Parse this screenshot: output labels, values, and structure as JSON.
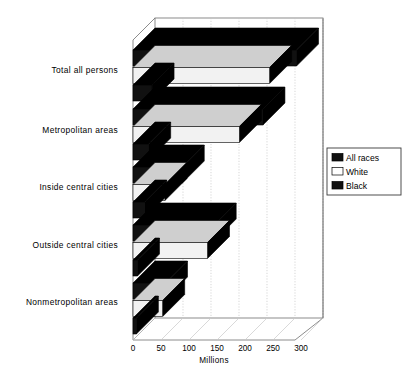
{
  "chart_data": {
    "type": "bar",
    "orientation": "horizontal",
    "style": "3d-grouped-horizontal-bar",
    "title": "",
    "subtitle": "",
    "xlabel": "Millions",
    "ylabel": "",
    "categories": [
      "Total all persons",
      "Metropolitan  areas",
      "Inside  central  cities",
      "Outside  central  cities",
      "Nonmetropolitan  areas"
    ],
    "series": [
      {
        "name": "All  races",
        "color": "#111111",
        "values": [
          292,
          232,
          88,
          145,
          58
        ]
      },
      {
        "name": "White",
        "color": "#f2f2f2",
        "values": [
          244,
          190,
          57,
          133,
          53
        ]
      },
      {
        "name": "Black",
        "color": "#111111",
        "values": [
          34,
          28,
          21,
          8,
          6
        ]
      }
    ],
    "xticks": [
      0,
      50,
      100,
      150,
      200,
      250,
      300
    ],
    "xtick_labels": [
      "0",
      "50",
      "100",
      "150",
      "200",
      "250",
      "300"
    ],
    "xlim": [
      0,
      300
    ],
    "grid": true,
    "grid_axis": "x",
    "legend_position": "right",
    "legend_entries": [
      {
        "label": "All  races",
        "swatch": "#111111"
      },
      {
        "label": "White",
        "swatch": "#ffffff"
      },
      {
        "label": "Black",
        "swatch": "#111111"
      }
    ]
  },
  "colors": {
    "bar_dark": "#111111",
    "bar_light": "#f2f2f2",
    "bar_side": "#000000",
    "frame": "#6e6e6e",
    "grid": "#bdbdbd",
    "legend_border": "#3a3a3a",
    "background": "#ffffff"
  }
}
